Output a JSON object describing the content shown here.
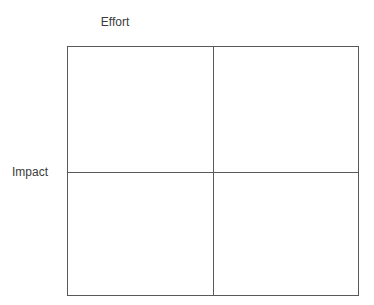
{
  "canvas": {
    "width": 374,
    "height": 305,
    "background_color": "#ffffff"
  },
  "axes": {
    "horizontal_axis_label": "Effort",
    "vertical_axis_label": "Impact",
    "label_color": "#3b3b3b"
  },
  "matrix": {
    "line_color": "#595959",
    "fill_color": "#ffffff",
    "rows": 2,
    "columns": 2,
    "quadrants": [
      {
        "position": "top-left",
        "label": ""
      },
      {
        "position": "top-right",
        "label": ""
      },
      {
        "position": "bottom-left",
        "label": ""
      },
      {
        "position": "bottom-right",
        "label": ""
      }
    ]
  },
  "chart_data": {
    "type": "scatter",
    "title": "",
    "xlabel": "Effort",
    "ylabel": "Impact",
    "x": [],
    "y": [],
    "series": [],
    "annotations": [],
    "grid": true,
    "legend": false,
    "xlim": [
      0,
      1
    ],
    "ylim": [
      0,
      1
    ],
    "xticks": [],
    "yticks": [],
    "note": "Empty 2x2 effort/impact prioritization matrix: outer rectangle with one vertical and one horizontal midline divider; no plotted points or quadrant labels."
  }
}
